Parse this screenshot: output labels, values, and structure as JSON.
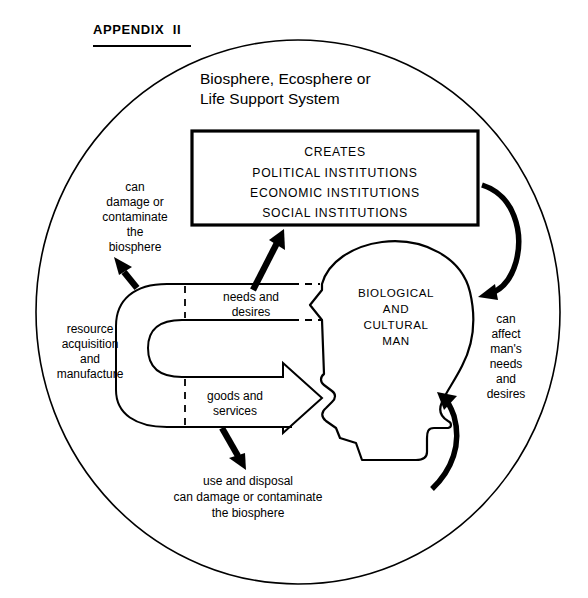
{
  "page": {
    "appendix_label": "APPENDIX  II",
    "width": 588,
    "height": 598,
    "background_color": "#ffffff",
    "ink_color": "#000000"
  },
  "diagram": {
    "type": "conceptual-systems-diagram",
    "outer_circle_label_line1": "Biosphere, Ecosphere or",
    "outer_circle_label_line2": "Life Support System",
    "institutions_box": {
      "lines": [
        "CREATES",
        "POLITICAL  INSTITUTIONS",
        "ECONOMIC  INSTITUTIONS",
        "SOCIAL  INSTITUTIONS"
      ]
    },
    "man_label": {
      "lines": [
        "BIOLOGICAL",
        "AND",
        "CULTURAL",
        "MAN"
      ]
    },
    "annotations": {
      "upper_left": {
        "lines": [
          "can",
          "damage or",
          "contaminate",
          "the",
          "biosphere"
        ]
      },
      "left": {
        "lines": [
          "resource",
          "acquisition",
          "and",
          "manufacture"
        ]
      },
      "upper_band": {
        "lines": [
          "needs and",
          "desires"
        ]
      },
      "lower_band": {
        "lines": [
          "goods and",
          "services"
        ]
      },
      "right": {
        "lines": [
          "can",
          "affect",
          "man's",
          "needs",
          "and",
          "desires"
        ]
      },
      "bottom": {
        "lines": [
          "use and disposal",
          "can damage or contaminate",
          "the biosphere"
        ]
      }
    }
  }
}
